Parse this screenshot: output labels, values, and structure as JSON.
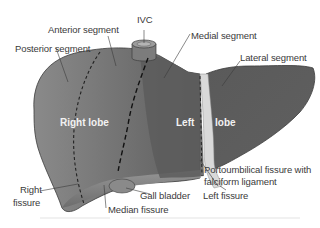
{
  "diagram": {
    "lobes": {
      "right": "Right lobe",
      "left_part1": "Left",
      "left_part2": "lobe"
    },
    "labels": {
      "ivc": "IVC",
      "anterior_segment": "Anterior segment",
      "posterior_segment": "Posterior segment",
      "medial_segment": "Medial segment",
      "lateral_segment": "Lateral segment",
      "right_fissure_1": "Right",
      "right_fissure_2": "fissure",
      "gall_bladder": "Gall bladder",
      "median_fissure": "Median fissure",
      "left_fissure": "Left fissure",
      "portoumbilical_1": "Portoumbilical fissure with",
      "portoumbilical_2": "falciform ligament"
    },
    "colors": {
      "liver_fill": "#6e6e6e",
      "liver_dark": "#555555",
      "liver_edge": "#3c3c3c",
      "ligament": "#d9d9d9",
      "gallbladder": "#8a8a8a",
      "label_text": "#3a3a3a",
      "lobe_text": "#f2f2f2"
    }
  }
}
